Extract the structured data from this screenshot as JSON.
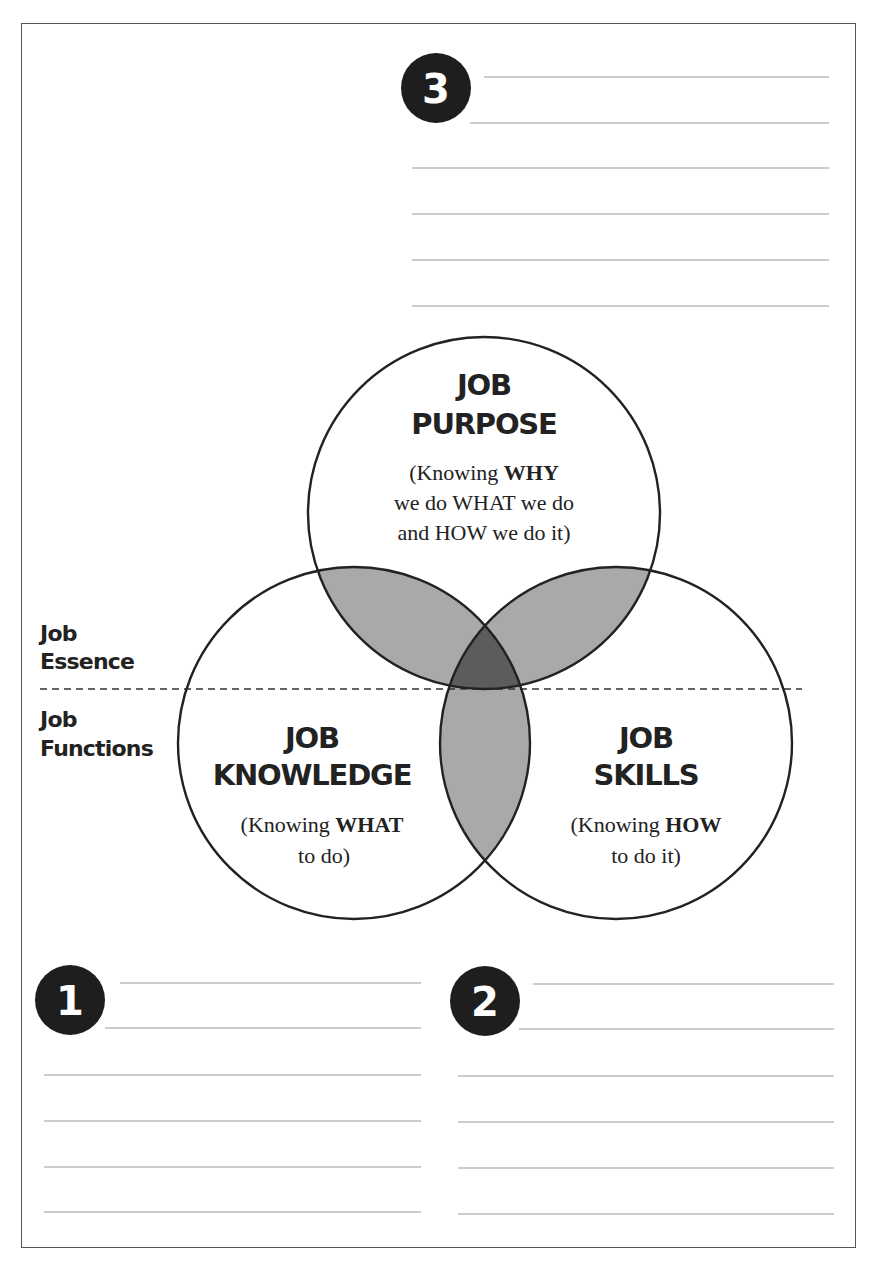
{
  "sections": {
    "top": {
      "badge": "3",
      "lines": 6
    },
    "bottom_left": {
      "badge": "1",
      "lines": 6
    },
    "bottom_right": {
      "badge": "2",
      "lines": 6
    }
  },
  "venn": {
    "purpose": {
      "title_line1": "JOB",
      "title_line2": "PURPOSE",
      "desc_line1_prefix": "(Knowing ",
      "desc_line1_bold": "WHY",
      "desc_line2": "we do WHAT we do",
      "desc_line3": "and HOW we do it)"
    },
    "knowledge": {
      "title_line1": "JOB",
      "title_line2": "KNOWLEDGE",
      "desc_line1_prefix": "(Knowing ",
      "desc_line1_bold": "WHAT",
      "desc_line2": "to do)"
    },
    "skills": {
      "title_line1": "JOB",
      "title_line2": "SKILLS",
      "desc_line1_prefix": "(Knowing ",
      "desc_line1_bold": "HOW",
      "desc_line2": "to do it)"
    }
  },
  "side_labels": {
    "essence_line1": "Job",
    "essence_line2": "Essence",
    "functions_line1": "Job",
    "functions_line2": "Functions"
  },
  "colors": {
    "outline": "#222222",
    "overlap_fill": "#a9a9a9",
    "center_fill": "#5c5c5c",
    "badge_fill": "#1e1e1e",
    "line_color": "#9a9a9a"
  }
}
